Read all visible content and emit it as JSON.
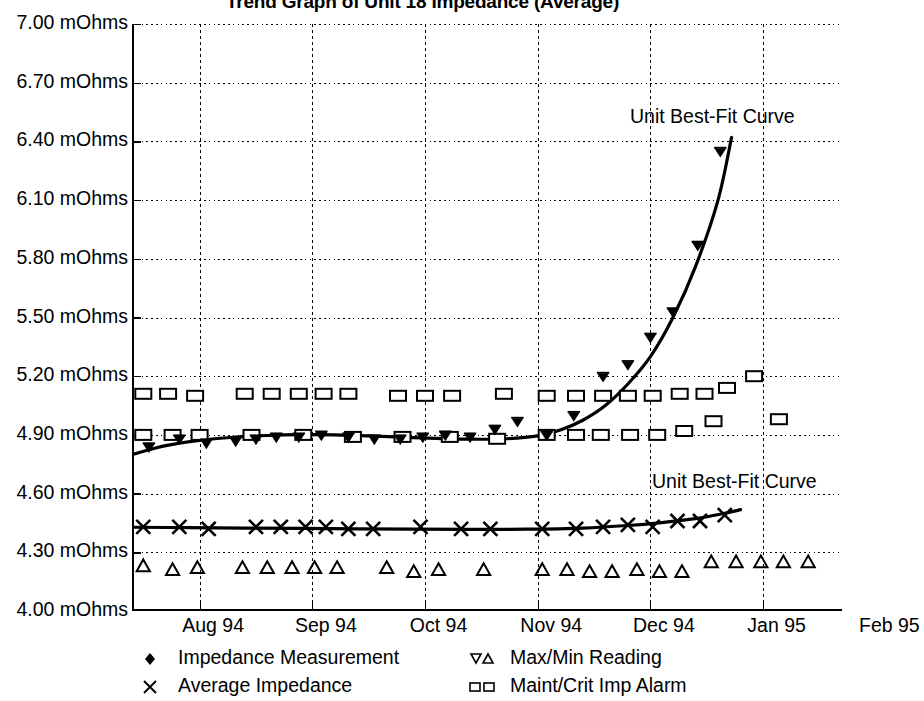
{
  "title": "Trend Graph of Unit 18 Impedance (Average)",
  "annotations": [
    {
      "text": "Unit Best-Fit Curve",
      "x": 630,
      "y": 105
    },
    {
      "text": "Unit Best-Fit Curve",
      "x": 652,
      "y": 470
    }
  ],
  "legend": {
    "items": [
      {
        "label": "Impedance Measurement",
        "marker": "filled-diamond-icon",
        "col": 0,
        "row": 0
      },
      {
        "label": "Average Impedance",
        "marker": "cross-x-icon",
        "col": 0,
        "row": 1
      },
      {
        "label": "Max/Min Reading",
        "marker": "up-down-triangle-icon",
        "col": 1,
        "row": 0
      },
      {
        "label": "Maint/Crit Imp Alarm",
        "marker": "double-square-icon",
        "col": 1,
        "row": 1
      }
    ]
  },
  "chart_data": {
    "type": "scatter",
    "title": "Trend Graph of Unit 18 Impedance (Average)",
    "xlabel": "",
    "ylabel": "",
    "grid": true,
    "legend_position": "bottom",
    "ylim": [
      4.0,
      7.0
    ],
    "ytick_labels": [
      "7.00 mOhms",
      "6.70 mOhms",
      "6.40 mOhms",
      "6.10 mOhms",
      "5.80 mOhms",
      "5.50 mOhms",
      "5.20 mOhms",
      "4.90 mOhms",
      "4.60 mOhms",
      "4.30 mOhms",
      "4.00 mOhms"
    ],
    "ytick_values": [
      7.0,
      6.7,
      6.4,
      6.1,
      5.8,
      5.5,
      5.2,
      4.9,
      4.6,
      4.3,
      4.0
    ],
    "xtick_labels": [
      "Aug 94",
      "Sep 94",
      "Oct 94",
      "Nov 94",
      "Dec 94",
      "Jan 95",
      "Feb 95"
    ],
    "xlim": [
      7.3,
      13.6
    ],
    "units": "mOhms",
    "series": [
      {
        "name": "Impedance Measurement",
        "marker": "filled-diamond",
        "points": [
          [
            7.45,
            4.84
          ],
          [
            7.72,
            4.88
          ],
          [
            7.96,
            4.86
          ],
          [
            8.22,
            4.87
          ],
          [
            8.4,
            4.88
          ],
          [
            8.58,
            4.89
          ],
          [
            8.78,
            4.89
          ],
          [
            8.98,
            4.9
          ],
          [
            9.22,
            4.89
          ],
          [
            9.45,
            4.88
          ],
          [
            9.68,
            4.88
          ],
          [
            9.88,
            4.89
          ],
          [
            10.08,
            4.9
          ],
          [
            10.3,
            4.89
          ],
          [
            10.52,
            4.93
          ],
          [
            10.72,
            4.97
          ],
          [
            10.98,
            4.9
          ],
          [
            11.22,
            5.0
          ],
          [
            11.48,
            5.2
          ],
          [
            11.7,
            5.26
          ],
          [
            11.9,
            5.4
          ],
          [
            12.1,
            5.53
          ],
          [
            12.32,
            5.87
          ],
          [
            12.52,
            6.35
          ]
        ]
      },
      {
        "name": "Average Impedance",
        "marker": "cross-x",
        "points": [
          [
            7.4,
            4.43
          ],
          [
            7.72,
            4.43
          ],
          [
            7.98,
            4.42
          ],
          [
            8.4,
            4.43
          ],
          [
            8.62,
            4.43
          ],
          [
            8.84,
            4.43
          ],
          [
            9.02,
            4.43
          ],
          [
            9.22,
            4.42
          ],
          [
            9.44,
            4.42
          ],
          [
            9.86,
            4.43
          ],
          [
            10.22,
            4.42
          ],
          [
            10.48,
            4.42
          ],
          [
            10.94,
            4.42
          ],
          [
            11.24,
            4.42
          ],
          [
            11.48,
            4.43
          ],
          [
            11.7,
            4.44
          ],
          [
            11.92,
            4.43
          ],
          [
            12.14,
            4.46
          ],
          [
            12.34,
            4.46
          ],
          [
            12.56,
            4.49
          ]
        ]
      },
      {
        "name": "Max/Min Reading",
        "marker": "up-triangle",
        "points": [
          [
            7.4,
            4.23
          ],
          [
            7.66,
            4.21
          ],
          [
            7.88,
            4.22
          ],
          [
            8.28,
            4.22
          ],
          [
            8.5,
            4.22
          ],
          [
            8.72,
            4.22
          ],
          [
            8.92,
            4.22
          ],
          [
            9.12,
            4.22
          ],
          [
            9.56,
            4.22
          ],
          [
            9.8,
            4.2
          ],
          [
            10.02,
            4.21
          ],
          [
            10.42,
            4.21
          ],
          [
            10.94,
            4.21
          ],
          [
            11.16,
            4.21
          ],
          [
            11.36,
            4.2
          ],
          [
            11.56,
            4.2
          ],
          [
            11.78,
            4.21
          ],
          [
            11.98,
            4.2
          ],
          [
            12.18,
            4.2
          ],
          [
            12.44,
            4.25
          ],
          [
            12.66,
            4.25
          ],
          [
            12.88,
            4.25
          ],
          [
            13.08,
            4.25
          ],
          [
            13.3,
            4.25
          ]
        ]
      },
      {
        "name": "Maint/Crit Imp Alarm (upper)",
        "marker": "open-square",
        "points": [
          [
            7.4,
            5.11
          ],
          [
            7.62,
            5.11
          ],
          [
            7.86,
            5.1
          ],
          [
            8.3,
            5.11
          ],
          [
            8.54,
            5.11
          ],
          [
            8.78,
            5.11
          ],
          [
            9.0,
            5.11
          ],
          [
            9.22,
            5.11
          ],
          [
            9.66,
            5.1
          ],
          [
            9.9,
            5.1
          ],
          [
            10.14,
            5.1
          ],
          [
            10.6,
            5.11
          ],
          [
            10.98,
            5.1
          ],
          [
            11.24,
            5.1
          ],
          [
            11.48,
            5.1
          ],
          [
            11.7,
            5.1
          ],
          [
            11.92,
            5.1
          ],
          [
            12.16,
            5.11
          ],
          [
            12.38,
            5.11
          ],
          [
            12.58,
            5.14
          ],
          [
            12.82,
            5.2
          ],
          [
            13.04,
            4.98
          ]
        ]
      },
      {
        "name": "Maint/Crit Imp Alarm (lower)",
        "marker": "open-square",
        "points": [
          [
            7.4,
            4.9
          ],
          [
            7.66,
            4.9
          ],
          [
            7.9,
            4.9
          ],
          [
            8.36,
            4.9
          ],
          [
            8.82,
            4.9
          ],
          [
            9.26,
            4.89
          ],
          [
            9.7,
            4.89
          ],
          [
            10.12,
            4.89
          ],
          [
            10.54,
            4.88
          ],
          [
            10.98,
            4.9
          ],
          [
            11.24,
            4.9
          ],
          [
            11.46,
            4.9
          ],
          [
            11.72,
            4.9
          ],
          [
            11.96,
            4.9
          ],
          [
            12.2,
            4.92
          ],
          [
            12.46,
            4.97
          ]
        ]
      }
    ],
    "fit_curves": [
      {
        "name": "Unit Best-Fit Curve (Impedance)",
        "label": "Unit Best-Fit Curve",
        "points": [
          [
            7.3,
            4.8
          ],
          [
            7.6,
            4.845
          ],
          [
            7.9,
            4.872
          ],
          [
            8.2,
            4.888
          ],
          [
            8.5,
            4.897
          ],
          [
            8.8,
            4.901
          ],
          [
            9.1,
            4.9
          ],
          [
            9.4,
            4.895
          ],
          [
            9.7,
            4.888
          ],
          [
            10.0,
            4.882
          ],
          [
            10.3,
            4.878
          ],
          [
            10.6,
            4.88
          ],
          [
            10.9,
            4.895
          ],
          [
            11.1,
            4.925
          ],
          [
            11.3,
            4.975
          ],
          [
            11.5,
            5.05
          ],
          [
            11.7,
            5.16
          ],
          [
            11.9,
            5.3
          ],
          [
            12.1,
            5.5
          ],
          [
            12.3,
            5.76
          ],
          [
            12.5,
            6.1
          ],
          [
            12.62,
            6.42
          ]
        ]
      },
      {
        "name": "Unit Best-Fit Curve (Average)",
        "label": "Unit Best-Fit Curve",
        "points": [
          [
            7.3,
            4.428
          ],
          [
            7.8,
            4.426
          ],
          [
            8.3,
            4.424
          ],
          [
            8.8,
            4.422
          ],
          [
            9.3,
            4.42
          ],
          [
            9.8,
            4.418
          ],
          [
            10.3,
            4.417
          ],
          [
            10.8,
            4.418
          ],
          [
            11.3,
            4.424
          ],
          [
            11.7,
            4.437
          ],
          [
            12.0,
            4.452
          ],
          [
            12.3,
            4.472
          ],
          [
            12.55,
            4.498
          ],
          [
            12.7,
            4.518
          ]
        ]
      }
    ]
  }
}
